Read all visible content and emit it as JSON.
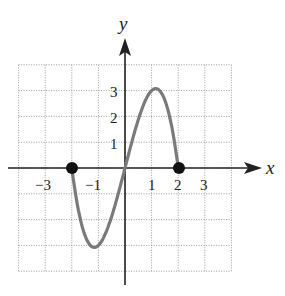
{
  "chart_data": {
    "type": "line",
    "title": "",
    "xlabel": "x",
    "ylabel": "y",
    "xlim": [
      -4,
      4
    ],
    "ylim": [
      -4,
      4
    ],
    "grid": true,
    "x_ticks": [
      "-3",
      "-1",
      "1",
      "2",
      "3"
    ],
    "y_ticks": [
      "1",
      "2",
      "3"
    ],
    "function": "f(x) = 4x - x^3, domain [-2, 2]",
    "series": [
      {
        "name": "f",
        "x": [
          -2,
          -1.75,
          -1.5,
          -1.15,
          -1,
          -0.5,
          0,
          0.5,
          1,
          1.15,
          1.5,
          1.75,
          2
        ],
        "y": [
          0,
          -1.64,
          -2.63,
          -3.08,
          -3,
          -1.88,
          0,
          1.88,
          3,
          3.08,
          2.63,
          1.64,
          0
        ]
      }
    ],
    "endpoints": [
      {
        "x": -2,
        "y": 0,
        "filled": true
      },
      {
        "x": 2,
        "y": 0,
        "filled": true
      }
    ],
    "colors": {
      "curve": "#7a7a7a",
      "axes": "#222222",
      "grid": "#9a9a9a",
      "points": "#111111"
    }
  },
  "labels": {
    "x_axis": "x",
    "y_axis": "y",
    "xt": [
      "−3",
      "−1",
      "1",
      "2",
      "3"
    ],
    "yt": [
      "3",
      "2",
      "1"
    ]
  }
}
